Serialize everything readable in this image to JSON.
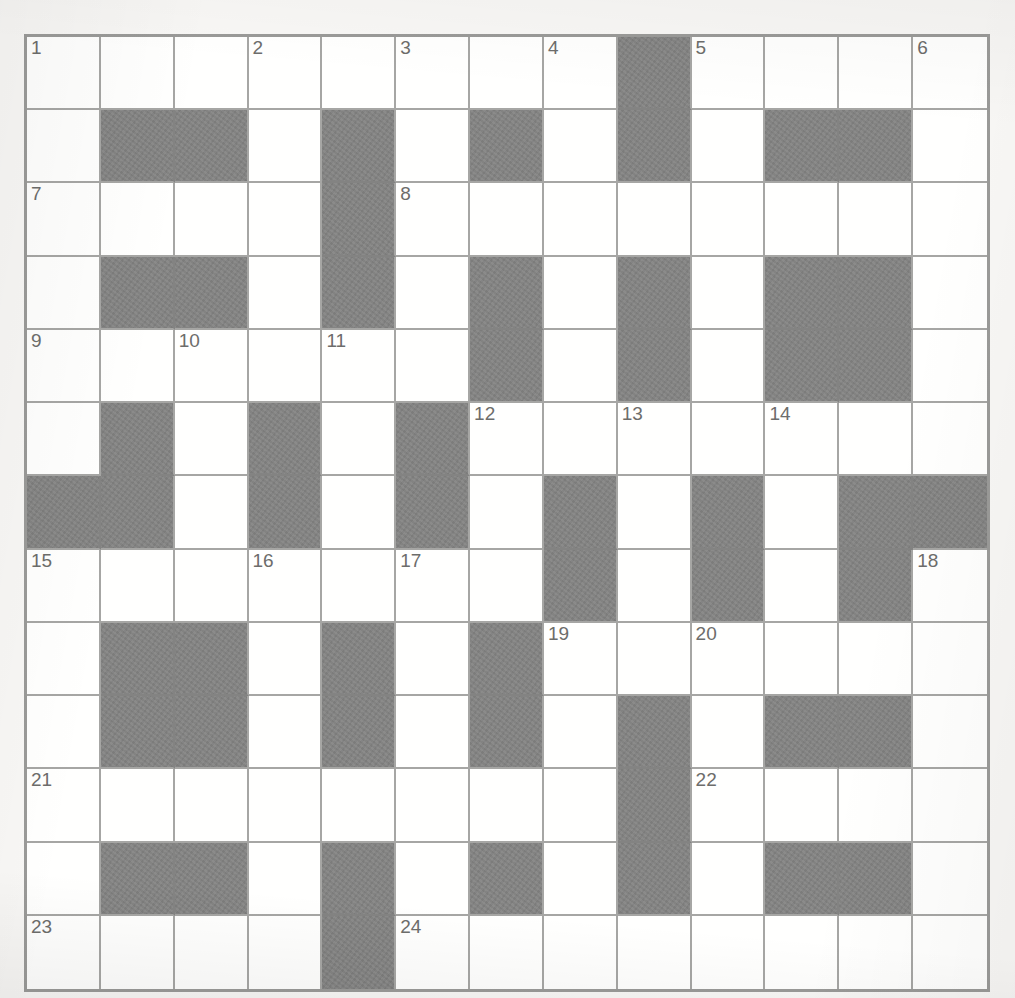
{
  "puzzle": {
    "kind": "crossword-grid",
    "columns": 13,
    "rows": 13,
    "colors": {
      "page_background": "#f8f7f5",
      "cell_white": "#fffffe",
      "cell_black": "#838382",
      "grid_line": "#a6a6a4",
      "outer_border": "#9a9a98",
      "clue_number": "#6d6d6b"
    },
    "legend": {
      "W": "white/open cell",
      "B": "black/blocked cell"
    },
    "grid": [
      [
        "W",
        "W",
        "W",
        "W",
        "W",
        "W",
        "W",
        "W",
        "B",
        "W",
        "W",
        "W",
        "W"
      ],
      [
        "W",
        "B",
        "B",
        "W",
        "B",
        "W",
        "B",
        "W",
        "B",
        "W",
        "B",
        "B",
        "W"
      ],
      [
        "W",
        "W",
        "W",
        "W",
        "B",
        "W",
        "W",
        "W",
        "W",
        "W",
        "W",
        "W",
        "W"
      ],
      [
        "W",
        "B",
        "B",
        "W",
        "B",
        "W",
        "B",
        "W",
        "B",
        "W",
        "B",
        "B",
        "W"
      ],
      [
        "W",
        "W",
        "W",
        "W",
        "W",
        "W",
        "B",
        "W",
        "B",
        "W",
        "B",
        "B",
        "W"
      ],
      [
        "W",
        "B",
        "W",
        "B",
        "W",
        "B",
        "W",
        "W",
        "W",
        "W",
        "W",
        "W",
        "W"
      ],
      [
        "B",
        "B",
        "W",
        "B",
        "W",
        "B",
        "W",
        "B",
        "W",
        "B",
        "W",
        "B",
        "B"
      ],
      [
        "W",
        "W",
        "W",
        "W",
        "W",
        "W",
        "W",
        "B",
        "W",
        "B",
        "W",
        "B",
        "W"
      ],
      [
        "W",
        "B",
        "B",
        "W",
        "B",
        "W",
        "B",
        "W",
        "W",
        "W",
        "W",
        "W",
        "W"
      ],
      [
        "W",
        "B",
        "B",
        "W",
        "B",
        "W",
        "B",
        "W",
        "B",
        "W",
        "B",
        "B",
        "W"
      ],
      [
        "W",
        "W",
        "W",
        "W",
        "W",
        "W",
        "W",
        "W",
        "B",
        "W",
        "W",
        "W",
        "W"
      ],
      [
        "W",
        "B",
        "B",
        "W",
        "B",
        "W",
        "B",
        "W",
        "B",
        "W",
        "B",
        "B",
        "W"
      ],
      [
        "W",
        "W",
        "W",
        "W",
        "B",
        "W",
        "W",
        "W",
        "W",
        "W",
        "W",
        "W",
        "W"
      ]
    ],
    "numbers": [
      {
        "n": "1",
        "row": 1,
        "col": 1
      },
      {
        "n": "2",
        "row": 1,
        "col": 4
      },
      {
        "n": "3",
        "row": 1,
        "col": 6
      },
      {
        "n": "4",
        "row": 1,
        "col": 8
      },
      {
        "n": "5",
        "row": 1,
        "col": 10
      },
      {
        "n": "6",
        "row": 1,
        "col": 13
      },
      {
        "n": "7",
        "row": 3,
        "col": 1
      },
      {
        "n": "8",
        "row": 3,
        "col": 6
      },
      {
        "n": "9",
        "row": 5,
        "col": 1
      },
      {
        "n": "10",
        "row": 5,
        "col": 3
      },
      {
        "n": "11",
        "row": 5,
        "col": 5
      },
      {
        "n": "12",
        "row": 6,
        "col": 7
      },
      {
        "n": "13",
        "row": 6,
        "col": 9
      },
      {
        "n": "14",
        "row": 6,
        "col": 11
      },
      {
        "n": "15",
        "row": 8,
        "col": 1
      },
      {
        "n": "16",
        "row": 8,
        "col": 4
      },
      {
        "n": "17",
        "row": 8,
        "col": 6
      },
      {
        "n": "18",
        "row": 8,
        "col": 13
      },
      {
        "n": "19",
        "row": 9,
        "col": 8
      },
      {
        "n": "20",
        "row": 9,
        "col": 10
      },
      {
        "n": "21",
        "row": 11,
        "col": 1
      },
      {
        "n": "22",
        "row": 11,
        "col": 10
      },
      {
        "n": "23",
        "row": 13,
        "col": 1
      },
      {
        "n": "24",
        "row": 13,
        "col": 6
      }
    ],
    "entries": []
  }
}
